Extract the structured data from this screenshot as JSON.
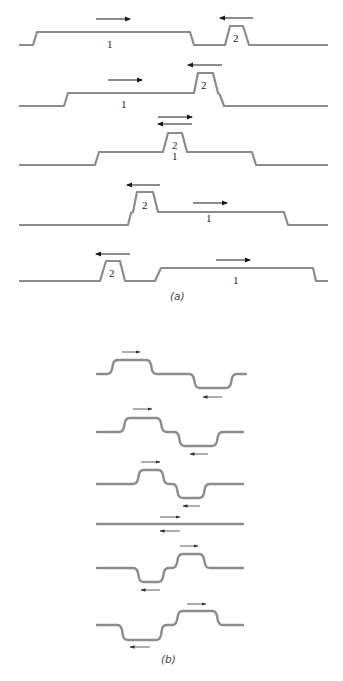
{
  "figure": {
    "panel_a": {
      "caption": "(a)",
      "rows": [
        {
          "pulse1_label": "1",
          "pulse2_label": "2"
        },
        {
          "pulse1_label": "1",
          "pulse2_label": "2"
        },
        {
          "pulse1_label": "1",
          "pulse2_label": "2"
        },
        {
          "pulse1_label": "1",
          "pulse2_label": "2"
        },
        {
          "pulse1_label": "1",
          "pulse2_label": "2"
        }
      ]
    },
    "panel_b": {
      "caption": "(b)"
    },
    "colors": {
      "wave": "#8c8c8c",
      "arrow": "#1a1a1a",
      "background": "#ffffff"
    }
  }
}
